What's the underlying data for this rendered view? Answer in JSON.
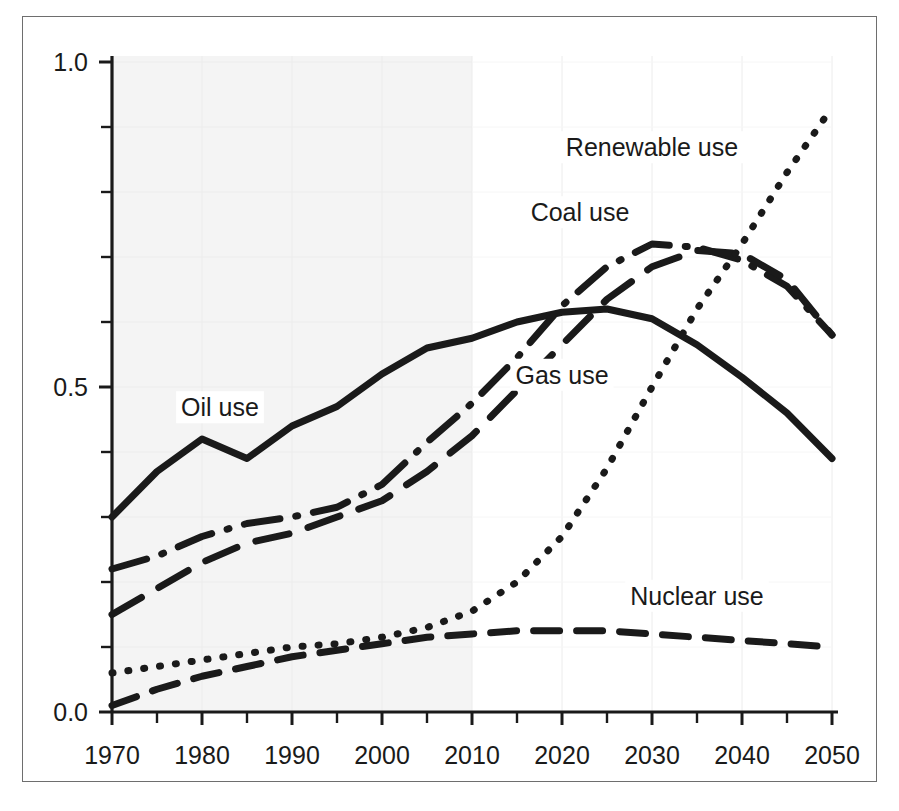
{
  "figure": {
    "name": "energy-use-projection-chart",
    "border_color": "#6e6e6e",
    "background": "#ffffff"
  },
  "chart_data": {
    "type": "line",
    "title": "",
    "subtitle": "",
    "xlabel": "",
    "ylabel": "",
    "xlim": [
      1970,
      2050
    ],
    "ylim": [
      0.0,
      1.0
    ],
    "grid": true,
    "grid_color": "#ececec",
    "legend_position": "inline-annotations",
    "shaded_region": {
      "label": "historical",
      "x_start": 1970,
      "x_end": 2010,
      "color": "#f4f4f4"
    },
    "x_ticks_major": [
      1970,
      1980,
      1990,
      2000,
      2010,
      2020,
      2030,
      2040,
      2050
    ],
    "x_tick_labels": [
      "1970",
      "1980",
      "1990",
      "2000",
      "2010",
      "2020",
      "2030",
      "2040",
      "2050"
    ],
    "x_ticks_minor": [
      1975,
      1985,
      1995,
      2005,
      2015,
      2025,
      2035,
      2045
    ],
    "y_ticks_major": [
      0.0,
      0.5,
      1.0
    ],
    "y_tick_labels": [
      "0.0",
      "0.5",
      "1.0"
    ],
    "y_ticks_minor": [
      0.1,
      0.2,
      0.3,
      0.4,
      0.6,
      0.7,
      0.8,
      0.9
    ],
    "x": [
      1970,
      1975,
      1980,
      1985,
      1990,
      1995,
      2000,
      2005,
      2010,
      2015,
      2020,
      2025,
      2030,
      2035,
      2040,
      2045,
      2050
    ],
    "series": [
      {
        "name": "Oil use",
        "label": "Oil use",
        "style": "solid",
        "color": "#1a1a1a",
        "label_x": 1982,
        "label_y": 0.455,
        "values": [
          0.3,
          0.37,
          0.42,
          0.39,
          0.44,
          0.47,
          0.52,
          0.56,
          0.575,
          0.6,
          0.615,
          0.62,
          0.605,
          0.565,
          0.515,
          0.46,
          0.39
        ]
      },
      {
        "name": "Coal use",
        "label": "Coal use",
        "style": "dash-dot",
        "color": "#1a1a1a",
        "label_x": 2022,
        "label_y": 0.755,
        "values": [
          0.22,
          0.24,
          0.27,
          0.29,
          0.3,
          0.315,
          0.35,
          0.415,
          0.475,
          0.545,
          0.625,
          0.685,
          0.72,
          0.715,
          0.695,
          0.655,
          0.58
        ]
      },
      {
        "name": "Gas use",
        "label": "Gas use",
        "style": "long-dash",
        "color": "#1a1a1a",
        "label_x": 2020,
        "label_y": 0.505,
        "values": [
          0.15,
          0.19,
          0.23,
          0.26,
          0.275,
          0.3,
          0.325,
          0.37,
          0.425,
          0.495,
          0.565,
          0.635,
          0.685,
          0.71,
          0.705,
          0.665,
          0.58
        ]
      },
      {
        "name": "Renewable use",
        "label": "Renewable use",
        "style": "dotted",
        "color": "#1a1a1a",
        "label_x": 2030,
        "label_y": 0.855,
        "values": [
          0.06,
          0.07,
          0.08,
          0.09,
          0.1,
          0.105,
          0.115,
          0.13,
          0.155,
          0.2,
          0.27,
          0.375,
          0.5,
          0.62,
          0.72,
          0.83,
          0.93
        ]
      },
      {
        "name": "Nuclear use",
        "label": "Nuclear use",
        "style": "dash",
        "color": "#1a1a1a",
        "label_x": 2035,
        "label_y": 0.165,
        "values": [
          0.01,
          0.035,
          0.055,
          0.07,
          0.085,
          0.095,
          0.105,
          0.115,
          0.12,
          0.125,
          0.125,
          0.125,
          0.12,
          0.115,
          0.11,
          0.105,
          0.1
        ]
      }
    ]
  }
}
